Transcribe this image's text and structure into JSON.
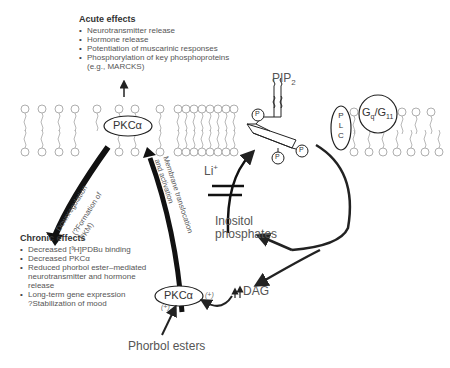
{
  "acute_effects": {
    "title": "Acute effects",
    "items": [
      "Neurotransmitter release",
      "Hormone release",
      "Potentiation of muscarinic responses",
      "Phosphorylation of key phosphoproteins",
      "(e.g., MARCKS)"
    ]
  },
  "chronic_effects": {
    "title": "Chronic effects",
    "items": [
      "Decreased [³H]PDBu binding",
      "Decreased PKCα",
      "Reduced phorbol ester–mediated",
      "neurotransmitter and hormone",
      "release",
      "Long-term gene expression",
      "?Stabilization of mood"
    ]
  },
  "labels": {
    "pkc_membrane": "PKCα",
    "pkc_cytosol": "PKCα",
    "pip2": "PIP",
    "pip2_sub": "2",
    "lithium": "Li",
    "lithium_sup": "+",
    "inositol_phosphates_1": "Inositol",
    "inositol_phosphates_2": "phosphates",
    "dag": "DAG",
    "phorbol_esters": "Phorbol esters",
    "plc_letters": [
      "P",
      "L",
      "C"
    ],
    "gq": "G",
    "gq_sub": "q",
    "g11": "/G",
    "g11_sub": "11",
    "phosphate": "P",
    "plus_left": "(+)",
    "plus_right": "(+)",
    "downregulation": "Downregulation",
    "formation_1": "(?Formation of",
    "formation_2": "PKM)",
    "translocation_1": "Membrane translocation",
    "translocation_2": "and activation"
  },
  "colors": {
    "line": "#222222",
    "text": "#555555",
    "membrane": "#888888"
  }
}
